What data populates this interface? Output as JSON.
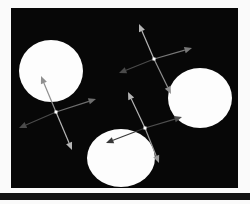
{
  "figure": {
    "width": 250,
    "height": 204,
    "background": "#fafafa",
    "canvas": {
      "x": 11,
      "y": 8,
      "width": 227,
      "height": 180,
      "color": "#070707"
    },
    "bottom_bar": {
      "x": 0,
      "y": 193,
      "width": 250,
      "height": 7,
      "color": "#131313"
    },
    "blob_color": "#fdfdfd",
    "dot_color": "#ffffff",
    "blobs": [
      {
        "id": "blob-top-left",
        "cx": 51,
        "cy": 71,
        "rx": 32,
        "ry": 31
      },
      {
        "id": "blob-right",
        "cx": 200,
        "cy": 98,
        "rx": 32,
        "ry": 30
      },
      {
        "id": "blob-bottom",
        "cx": 121,
        "cy": 158,
        "rx": 34,
        "ry": 29
      }
    ],
    "crosses": [
      {
        "id": "axes-left",
        "dot": {
          "x": 56,
          "y": 112
        },
        "arms": [
          {
            "dir": "up",
            "tip_x": 41,
            "tip_y": 76,
            "color": "#8f8f8f"
          },
          {
            "dir": "down",
            "tip_x": 72,
            "tip_y": 150,
            "color": "#b5b5b5"
          },
          {
            "dir": "left",
            "tip_x": 19,
            "tip_y": 128,
            "color": "#4a4a4a"
          },
          {
            "dir": "right",
            "tip_x": 96,
            "tip_y": 99,
            "color": "#6e6e6e"
          }
        ]
      },
      {
        "id": "axes-top-right",
        "dot": {
          "x": 154,
          "y": 59
        },
        "arms": [
          {
            "dir": "up",
            "tip_x": 139,
            "tip_y": 24,
            "color": "#b5b5b5"
          },
          {
            "dir": "down",
            "tip_x": 171,
            "tip_y": 94,
            "color": "#8f8f8f"
          },
          {
            "dir": "left",
            "tip_x": 119,
            "tip_y": 73,
            "color": "#4a4a4a"
          },
          {
            "dir": "right",
            "tip_x": 192,
            "tip_y": 48,
            "color": "#787878"
          }
        ]
      },
      {
        "id": "axes-bottom-middle",
        "dot": {
          "x": 145,
          "y": 128
        },
        "arms": [
          {
            "dir": "up",
            "tip_x": 128,
            "tip_y": 92,
            "color": "#b5b5b5"
          },
          {
            "dir": "down",
            "tip_x": 159,
            "tip_y": 163,
            "color": "#9a9a9a"
          },
          {
            "dir": "left",
            "tip_x": 106,
            "tip_y": 143,
            "color": "#383838"
          },
          {
            "dir": "right",
            "tip_x": 182,
            "tip_y": 117,
            "color": "#4f4f4f"
          }
        ]
      }
    ],
    "arrow_style": {
      "line_width": 1.2,
      "head_length": 7.5,
      "head_half_width": 3.2,
      "dot_size": 3
    }
  }
}
